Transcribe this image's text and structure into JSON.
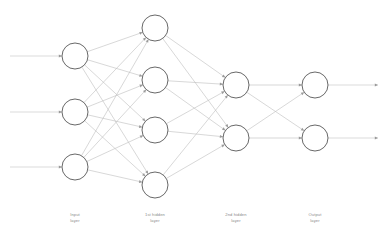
{
  "canvas": {
    "width": 389,
    "height": 243,
    "background": "#ffffff"
  },
  "style": {
    "node_stroke": "#4d4d4d",
    "node_fill": "#ffffff",
    "edge_color": "#bdbdbd",
    "io_edge_color": "#c4c4c4",
    "arrow_color": "#9a9a9a",
    "label_color": "#8a8a8a",
    "node_radius": 13,
    "edge_width": 0.6,
    "node_stroke_width": 0.85
  },
  "diagram": {
    "type": "feedforward-neural-network",
    "fully_connected": true,
    "layers": [
      {
        "id": "input",
        "label_line1": "Input",
        "label_line2": "layer",
        "label_x": 40,
        "label_y": 212,
        "node_count": 3,
        "cx": 75,
        "node_y": [
          56,
          112,
          167
        ],
        "has_incoming_arrows": true,
        "has_outgoing_arrows": false,
        "incoming_start_x": 10
      },
      {
        "id": "hidden1",
        "label_line1": "1st hidden",
        "label_line2": "layer",
        "label_x": 120,
        "label_y": 212,
        "node_count": 4,
        "cx": 155,
        "node_y": [
          28,
          80,
          130,
          185
        ],
        "has_incoming_arrows": false,
        "has_outgoing_arrows": false,
        "incoming_start_x": 0
      },
      {
        "id": "hidden2",
        "label_line1": "2nd hidden",
        "label_line2": "layer",
        "label_x": 201,
        "label_y": 212,
        "node_count": 2,
        "cx": 236,
        "node_y": [
          85,
          138
        ],
        "has_incoming_arrows": false,
        "has_outgoing_arrows": false,
        "incoming_start_x": 0
      },
      {
        "id": "output",
        "label_line1": "Output",
        "label_line2": "layer",
        "label_x": 280,
        "label_y": 212,
        "node_count": 2,
        "cx": 315,
        "node_y": [
          85,
          138
        ],
        "has_incoming_arrows": false,
        "has_outgoing_arrows": true,
        "outgoing_end_x": 378
      }
    ]
  }
}
